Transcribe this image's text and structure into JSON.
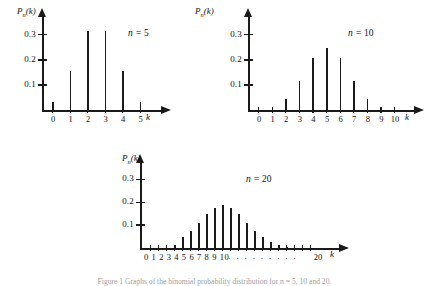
{
  "figure": {
    "caption": "Figure 1   Graphs of the binomial probability distribution for n = 5, 10 and 20.",
    "axis_label_y": "P",
    "axis_label_y_sub": "n",
    "axis_label_y_tail": "(k)",
    "axis_label_x": "k"
  },
  "chart_data": [
    {
      "type": "bar",
      "title": "n = 5",
      "n": 5,
      "categories": [
        "0",
        "1",
        "2",
        "3",
        "4",
        "5"
      ],
      "values": [
        0.031,
        0.156,
        0.313,
        0.313,
        0.156,
        0.031
      ],
      "xlabel": "k",
      "ylabel": "P_n(k)",
      "yticks": [
        "0.1",
        "0.2",
        "0.3"
      ],
      "ytickvalues": [
        0.1,
        0.2,
        0.3
      ],
      "ylim": [
        0,
        0.35
      ],
      "grid": false,
      "legend": "none"
    },
    {
      "type": "bar",
      "title": "n = 10",
      "n": 10,
      "categories": [
        "0",
        "1",
        "2",
        "3",
        "4",
        "5",
        "6",
        "7",
        "8",
        "9",
        "10"
      ],
      "values": [
        0.001,
        0.01,
        0.044,
        0.117,
        0.205,
        0.246,
        0.205,
        0.117,
        0.044,
        0.01,
        0.001
      ],
      "xlabel": "k",
      "ylabel": "P_n(k)",
      "yticks": [
        "0.1",
        "0.2",
        "0.3"
      ],
      "ytickvalues": [
        0.1,
        0.2,
        0.3
      ],
      "ylim": [
        0,
        0.35
      ],
      "grid": false,
      "legend": "none"
    },
    {
      "type": "bar",
      "title": "n = 20",
      "n": 20,
      "categories": [
        "0",
        "1",
        "2",
        "3",
        "4",
        "5",
        "6",
        "7",
        "8",
        "9",
        "10",
        "",
        "",
        "",
        "",
        "",
        "",
        "",
        "",
        "",
        "20"
      ],
      "tick_label_text": "0 1 2 3 4 5 6 7 8 9 10",
      "tick_label_end": "20",
      "tick_label_dots": "· · · · · · · · ·",
      "values": [
        0.0,
        0.0,
        0.002,
        0.011,
        0.046,
        0.074,
        0.11,
        0.148,
        0.176,
        0.186,
        0.176,
        0.148,
        0.11,
        0.074,
        0.046,
        0.025,
        0.011,
        0.004,
        0.002,
        0.0,
        0.0
      ],
      "xlabel": "k",
      "ylabel": "P_n(k)",
      "yticks": [
        "0.1",
        "0.2",
        "0.3"
      ],
      "ytickvalues": [
        0.1,
        0.2,
        0.3
      ],
      "ylim": [
        0,
        0.35
      ],
      "grid": false,
      "legend": "none"
    }
  ]
}
